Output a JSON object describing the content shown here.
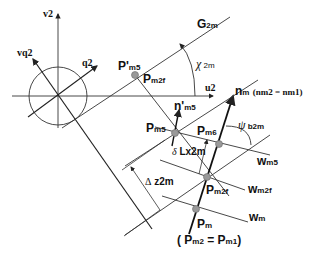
{
  "diagram": {
    "type": "gear geometry coordinate diagram",
    "axes": {
      "v2": "v2",
      "u2": "u2",
      "vq2": "vq2",
      "q2": "q2"
    },
    "lines": {
      "G": {
        "main": "G",
        "sub": "2m"
      },
      "n_m": {
        "main": "n",
        "sub": "m",
        "extra": "(nm2 = nm1)"
      },
      "n_prime_m5": {
        "main": "n'",
        "sub": "m5"
      },
      "w_m5": {
        "main": "w",
        "sub": "m5"
      },
      "w_m2f": {
        "main": "w",
        "sub": "m2f"
      },
      "w_m": {
        "main": "w",
        "sub": "m"
      }
    },
    "points": {
      "P_prime_m5": {
        "main": "P'",
        "sub": "m5"
      },
      "P_m2f_upper": {
        "main": "P",
        "sub": "m2f"
      },
      "P_m5": {
        "main": "P",
        "sub": "m5"
      },
      "P_m6": {
        "main": "P",
        "sub": "m6"
      },
      "P_m2f": {
        "main": "P",
        "sub": "m2f"
      },
      "P_m": {
        "main": "P",
        "sub": "m"
      },
      "P_m_note": {
        "open": "( P",
        "sub1": "m2",
        "mid": " = P",
        "sub2": "m1",
        "close": ")"
      }
    },
    "angles": {
      "chi": {
        "symbol": "χ",
        "sub": " 2m"
      },
      "psi": {
        "symbol": "ψ",
        "sub": " b2m"
      }
    },
    "dimensions": {
      "delta_L": {
        "symbol": "δ",
        "text": " Lx2m"
      },
      "delta_z": {
        "symbol": "Δ",
        "text": " z2m"
      }
    },
    "colors": {
      "line": "#222222",
      "point_fill": "#999999"
    }
  }
}
